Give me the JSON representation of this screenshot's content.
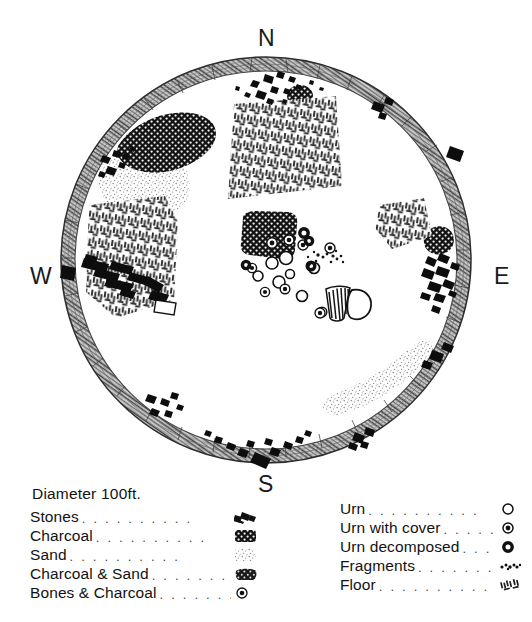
{
  "figure": {
    "type": "archaeological-site-plan",
    "shape": "circular-enclosure",
    "cardinals": {
      "north": "N",
      "south": "S",
      "east": "E",
      "west": "W"
    }
  },
  "legend_left": {
    "title": "Diameter  100ft.",
    "dots": ". . . . . . . . . .",
    "items": [
      {
        "label": "Stones",
        "symbol": "stones-swatch"
      },
      {
        "label": "Charcoal",
        "symbol": "charcoal-swatch"
      },
      {
        "label": "Sand",
        "symbol": "sand-swatch"
      },
      {
        "label": "Charcoal & Sand",
        "symbol": "charcoal-sand-swatch"
      },
      {
        "label": "Bones & Charcoal",
        "symbol": "bones-charcoal-swatch"
      }
    ]
  },
  "legend_right": {
    "dots": ". . . . . . . . . .",
    "items": [
      {
        "label": "Urn",
        "symbol": "urn-symbol"
      },
      {
        "label": "Urn with cover",
        "symbol": "urn-with-cover-symbol"
      },
      {
        "label": "Urn decomposed",
        "symbol": "urn-decomposed-symbol"
      },
      {
        "label": "Fragments",
        "symbol": "fragments-symbol"
      },
      {
        "label": "Floor",
        "symbol": "floor-swatch"
      }
    ]
  },
  "colors": {
    "ink": "#111111",
    "charcoal": "#1b1b1b",
    "sand": "#b9b9b9",
    "floor_hatch": "#2a2a2a",
    "background": "#ffffff"
  }
}
